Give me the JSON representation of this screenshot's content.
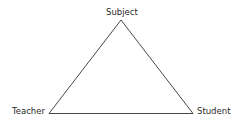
{
  "diagram": {
    "type": "triangle",
    "vertices": {
      "top": {
        "label": "Subject"
      },
      "left": {
        "label": "Teacher"
      },
      "right": {
        "label": "Student"
      }
    },
    "line_color": "#333333"
  }
}
